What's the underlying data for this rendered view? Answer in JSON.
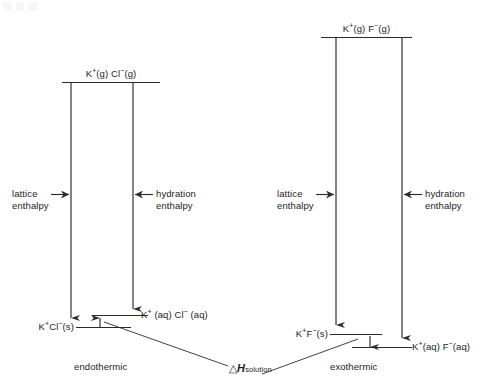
{
  "diagram": {
    "type": "energy-level-diagram",
    "title_visible": false,
    "panels": [
      {
        "id": "kcl",
        "name": "potassium-chloride",
        "top_level_label": "K+(g) Cl−(g)",
        "top_level_parts": {
          "cation": "K",
          "cation_charge": "+",
          "cation_state": "(g)",
          "anion": "Cl",
          "anion_charge": "−",
          "anion_state": "(g)"
        },
        "solid_label": "K+Cl−(s)",
        "aqueous_label": "K+ (aq) Cl− (aq)",
        "left_arrow_label_line1": "lattice",
        "left_arrow_label_line2": "enthalpy",
        "right_arrow_label_line1": "hydration",
        "right_arrow_label_line2": "enthalpy",
        "outcome_label": "endothermic",
        "delta_h_direction": "up",
        "relative_levels": {
          "gaseous_ions": 1.0,
          "aqueous_ions": 0.045,
          "solid": 0.0
        }
      },
      {
        "id": "kf",
        "name": "potassium-fluoride",
        "top_level_label": "K+(g) F−(g)",
        "top_level_parts": {
          "cation": "K",
          "cation_charge": "+",
          "cation_state": "(g)",
          "anion": "F",
          "anion_charge": "−",
          "anion_state": "(g)"
        },
        "solid_label": "K+F−(s)",
        "aqueous_label": "K+(aq) F−(aq)",
        "left_arrow_label_line1": "lattice",
        "left_arrow_label_line2": "enthalpy",
        "right_arrow_label_line1": "hydration",
        "right_arrow_label_line2": "enthalpy",
        "outcome_label": "exothermic",
        "delta_h_direction": "down",
        "relative_levels": {
          "gaseous_ions": 1.0,
          "solid": 0.048,
          "aqueous_ions": 0.0
        }
      }
    ],
    "shared_annotation": {
      "delta_symbol": "△",
      "h_symbol": "H",
      "subscript": "solution",
      "full_text": "△H solution"
    },
    "colors": {
      "stroke": "#2b2b2b",
      "text": "#1d1d1d",
      "background": "#ffffff"
    }
  }
}
